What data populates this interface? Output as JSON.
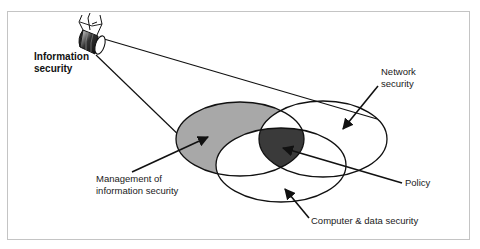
{
  "diagram": {
    "type": "venn-with-camera",
    "colors": {
      "frame_border": "#c4c4c4",
      "management_fill": "#a8a8a8",
      "policy_fill": "#3a3a3a",
      "stroke": "#111111"
    },
    "camera": {
      "label_line1": "Information",
      "label_line2": "security"
    },
    "sets": [
      {
        "id": "management",
        "label_line1": "Management of",
        "label_line2": "information security"
      },
      {
        "id": "network",
        "label_line1": "Network",
        "label_line2": "security"
      },
      {
        "id": "computer",
        "label_line1": "Computer & data security"
      }
    ],
    "intersection": {
      "label": "Policy"
    }
  }
}
